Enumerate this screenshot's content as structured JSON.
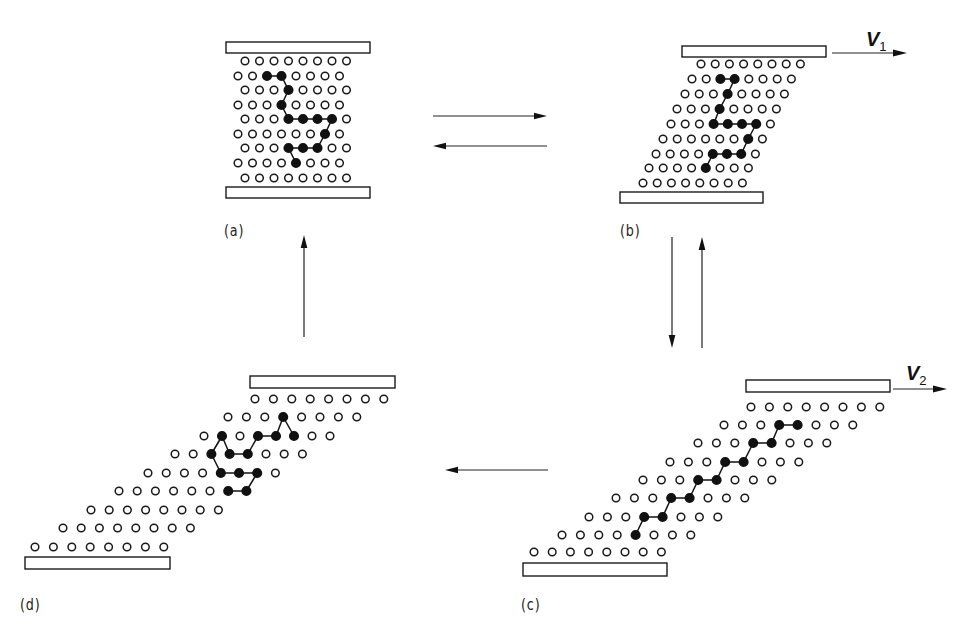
{
  "figure": {
    "colors": {
      "line": "#111111",
      "background": "#ffffff"
    }
  },
  "panels": [
    {
      "id": "a",
      "label": "(a)",
      "label_pos": [
        224,
        222
      ],
      "plates": [
        {
          "x": 226,
          "y": 42,
          "w": 144,
          "h": 11
        },
        {
          "x": 226,
          "y": 187,
          "w": 144,
          "h": 11
        }
      ],
      "rows": [
        {
          "y": 61,
          "x0": 245,
          "dx": 14.5
        },
        {
          "y": 76,
          "x0": 238,
          "dx": 14.5
        },
        {
          "y": 90,
          "x0": 245,
          "dx": 14.5
        },
        {
          "y": 105,
          "x0": 238,
          "dx": 14.5
        },
        {
          "y": 119,
          "x0": 245,
          "dx": 14.5
        },
        {
          "y": 134,
          "x0": 238,
          "dx": 14.5
        },
        {
          "y": 148,
          "x0": 245,
          "dx": 14.5
        },
        {
          "y": 163,
          "x0": 238,
          "dx": 14.5
        },
        {
          "y": 178,
          "x0": 245,
          "dx": 14.5
        }
      ],
      "dark": [
        [
          1,
          2
        ],
        [
          1,
          3
        ],
        [
          2,
          3
        ],
        [
          3,
          3
        ],
        [
          4,
          3
        ],
        [
          4,
          4
        ],
        [
          4,
          5
        ],
        [
          4,
          6
        ],
        [
          5,
          6
        ],
        [
          6,
          3
        ],
        [
          6,
          4
        ],
        [
          6,
          5
        ],
        [
          7,
          4
        ]
      ],
      "bonds": [
        [
          [
            1,
            2
          ],
          [
            1,
            3
          ]
        ],
        [
          [
            1,
            3
          ],
          [
            2,
            3
          ]
        ],
        [
          [
            2,
            3
          ],
          [
            3,
            3
          ]
        ],
        [
          [
            3,
            3
          ],
          [
            4,
            3
          ]
        ],
        [
          [
            4,
            3
          ],
          [
            4,
            4
          ]
        ],
        [
          [
            4,
            4
          ],
          [
            4,
            5
          ]
        ],
        [
          [
            4,
            5
          ],
          [
            4,
            6
          ]
        ],
        [
          [
            4,
            6
          ],
          [
            5,
            6
          ]
        ],
        [
          [
            5,
            6
          ],
          [
            6,
            5
          ]
        ],
        [
          [
            6,
            5
          ],
          [
            6,
            4
          ]
        ],
        [
          [
            6,
            4
          ],
          [
            6,
            3
          ]
        ],
        [
          [
            6,
            3
          ],
          [
            7,
            4
          ]
        ]
      ]
    },
    {
      "id": "b",
      "label": "(b)",
      "label_pos": [
        620,
        222
      ],
      "plates": [
        {
          "x": 682,
          "y": 46,
          "w": 144,
          "h": 11
        },
        {
          "x": 620,
          "y": 192,
          "w": 143,
          "h": 11
        }
      ],
      "velocity": {
        "label": "V",
        "sub": "1",
        "arrow": [
          832,
          53,
          907,
          53
        ],
        "label_pos": [
          866,
          28
        ]
      },
      "rows": [
        {
          "y": 64,
          "x0": 701,
          "dx": 14.2
        },
        {
          "y": 79,
          "x0": 692,
          "dx": 14.2
        },
        {
          "y": 94,
          "x0": 685,
          "dx": 14.2
        },
        {
          "y": 109,
          "x0": 677,
          "dx": 14.2
        },
        {
          "y": 124,
          "x0": 671,
          "dx": 14.2
        },
        {
          "y": 139,
          "x0": 663,
          "dx": 14.2
        },
        {
          "y": 154,
          "x0": 656,
          "dx": 14.2
        },
        {
          "y": 168,
          "x0": 649,
          "dx": 14.2
        },
        {
          "y": 183,
          "x0": 643,
          "dx": 14.2
        }
      ],
      "dark": [
        [
          1,
          2
        ],
        [
          1,
          3
        ],
        [
          2,
          3
        ],
        [
          3,
          3
        ],
        [
          4,
          3
        ],
        [
          4,
          4
        ],
        [
          4,
          5
        ],
        [
          4,
          6
        ],
        [
          5,
          6
        ],
        [
          6,
          4
        ],
        [
          6,
          5
        ],
        [
          6,
          6
        ],
        [
          7,
          4
        ]
      ],
      "bonds": [
        [
          [
            1,
            2
          ],
          [
            1,
            3
          ]
        ],
        [
          [
            1,
            3
          ],
          [
            2,
            3
          ]
        ],
        [
          [
            2,
            3
          ],
          [
            3,
            3
          ]
        ],
        [
          [
            3,
            3
          ],
          [
            4,
            3
          ]
        ],
        [
          [
            4,
            3
          ],
          [
            4,
            4
          ]
        ],
        [
          [
            4,
            4
          ],
          [
            4,
            5
          ]
        ],
        [
          [
            4,
            5
          ],
          [
            4,
            6
          ]
        ],
        [
          [
            4,
            6
          ],
          [
            5,
            6
          ]
        ],
        [
          [
            5,
            6
          ],
          [
            6,
            6
          ]
        ],
        [
          [
            6,
            6
          ],
          [
            6,
            5
          ]
        ],
        [
          [
            6,
            5
          ],
          [
            6,
            4
          ]
        ],
        [
          [
            6,
            4
          ],
          [
            7,
            4
          ]
        ]
      ]
    },
    {
      "id": "c",
      "label": "(c)",
      "label_pos": [
        521,
        596
      ],
      "plates": [
        {
          "x": 746,
          "y": 380,
          "w": 144,
          "h": 12
        },
        {
          "x": 523,
          "y": 563,
          "w": 144,
          "h": 13
        }
      ],
      "velocity": {
        "label": "V",
        "sub": "2",
        "arrow": [
          893,
          389,
          947,
          389
        ],
        "label_pos": [
          906,
          362
        ]
      },
      "rows": [
        {
          "y": 407,
          "x0": 751,
          "dx": 18.4
        },
        {
          "y": 425,
          "x0": 724,
          "dx": 18.4
        },
        {
          "y": 443,
          "x0": 698,
          "dx": 18.4
        },
        {
          "y": 462,
          "x0": 670,
          "dx": 18.4
        },
        {
          "y": 480,
          "x0": 643,
          "dx": 18.4
        },
        {
          "y": 498,
          "x0": 616,
          "dx": 18.4
        },
        {
          "y": 517,
          "x0": 589,
          "dx": 18.4
        },
        {
          "y": 535,
          "x0": 562,
          "dx": 18.4
        },
        {
          "y": 552,
          "x0": 534,
          "dx": 18.2
        }
      ],
      "dark": [
        [
          1,
          3
        ],
        [
          1,
          4
        ],
        [
          2,
          3
        ],
        [
          2,
          4
        ],
        [
          3,
          3
        ],
        [
          3,
          4
        ],
        [
          4,
          3
        ],
        [
          4,
          4
        ],
        [
          5,
          3
        ],
        [
          5,
          4
        ],
        [
          6,
          3
        ],
        [
          6,
          4
        ],
        [
          7,
          4
        ]
      ],
      "bonds": [
        [
          [
            1,
            3
          ],
          [
            1,
            4
          ]
        ],
        [
          [
            2,
            4
          ],
          [
            1,
            3
          ]
        ],
        [
          [
            2,
            3
          ],
          [
            2,
            4
          ]
        ],
        [
          [
            3,
            4
          ],
          [
            2,
            3
          ]
        ],
        [
          [
            3,
            3
          ],
          [
            3,
            4
          ]
        ],
        [
          [
            4,
            4
          ],
          [
            3,
            3
          ]
        ],
        [
          [
            4,
            3
          ],
          [
            4,
            4
          ]
        ],
        [
          [
            5,
            4
          ],
          [
            4,
            3
          ]
        ],
        [
          [
            5,
            3
          ],
          [
            5,
            4
          ]
        ],
        [
          [
            6,
            4
          ],
          [
            5,
            3
          ]
        ],
        [
          [
            6,
            3
          ],
          [
            6,
            4
          ]
        ],
        [
          [
            7,
            4
          ],
          [
            6,
            3
          ]
        ]
      ]
    },
    {
      "id": "d",
      "label": "(d)",
      "label_pos": [
        20,
        596
      ],
      "plates": [
        {
          "x": 250,
          "y": 376,
          "w": 145,
          "h": 12
        },
        {
          "x": 25,
          "y": 557,
          "w": 145,
          "h": 12
        }
      ],
      "rows": [
        {
          "y": 399,
          "x0": 255,
          "dx": 18.4
        },
        {
          "y": 417,
          "x0": 228,
          "dx": 18.4
        },
        {
          "y": 436,
          "x0": 204,
          "dx": 18.0
        },
        {
          "y": 454,
          "x0": 175,
          "dx": 18.2
        },
        {
          "y": 473,
          "x0": 148,
          "dx": 18.2
        },
        {
          "y": 491,
          "x0": 119,
          "dx": 18.2
        },
        {
          "y": 510,
          "x0": 91,
          "dx": 18.2
        },
        {
          "y": 528,
          "x0": 63,
          "dx": 18.2
        },
        {
          "y": 547,
          "x0": 35,
          "dx": 18.4
        }
      ],
      "dark": [
        [
          1,
          3
        ],
        [
          2,
          1
        ],
        [
          2,
          3
        ],
        [
          2,
          4
        ],
        [
          2,
          5
        ],
        [
          3,
          2
        ],
        [
          3,
          3
        ],
        [
          3,
          4
        ],
        [
          4,
          4
        ],
        [
          4,
          5
        ],
        [
          4,
          6
        ],
        [
          5,
          6
        ],
        [
          5,
          7
        ]
      ],
      "bonds": [
        [
          [
            1,
            3
          ],
          [
            2,
            5
          ]
        ],
        [
          [
            1,
            3
          ],
          [
            2,
            4
          ]
        ],
        [
          [
            2,
            4
          ],
          [
            2,
            3
          ]
        ],
        [
          [
            2,
            3
          ],
          [
            3,
            4
          ]
        ],
        [
          [
            3,
            4
          ],
          [
            3,
            3
          ]
        ],
        [
          [
            3,
            3
          ],
          [
            2,
            1
          ]
        ],
        [
          [
            2,
            1
          ],
          [
            3,
            2
          ]
        ],
        [
          [
            3,
            2
          ],
          [
            4,
            4
          ]
        ],
        [
          [
            4,
            4
          ],
          [
            4,
            5
          ]
        ],
        [
          [
            4,
            5
          ],
          [
            4,
            6
          ]
        ],
        [
          [
            4,
            6
          ],
          [
            5,
            7
          ]
        ],
        [
          [
            5,
            7
          ],
          [
            5,
            6
          ]
        ]
      ]
    }
  ],
  "transitions": [
    {
      "name": "a-to-b-arrow",
      "from": [
        433,
        116
      ],
      "to": [
        547,
        116
      ]
    },
    {
      "name": "b-to-a-arrow",
      "from": [
        547,
        146
      ],
      "to": [
        433,
        146
      ]
    },
    {
      "name": "b-to-c-arrow",
      "from": [
        672,
        237
      ],
      "to": [
        672,
        348
      ]
    },
    {
      "name": "c-to-b-arrow",
      "from": [
        702,
        348
      ],
      "to": [
        702,
        237
      ]
    },
    {
      "name": "c-to-d-arrow",
      "from": [
        548,
        470
      ],
      "to": [
        445,
        470
      ]
    },
    {
      "name": "d-to-a-arrow",
      "from": [
        304,
        337
      ],
      "to": [
        304,
        235
      ]
    }
  ],
  "atoms_per_row": 8
}
